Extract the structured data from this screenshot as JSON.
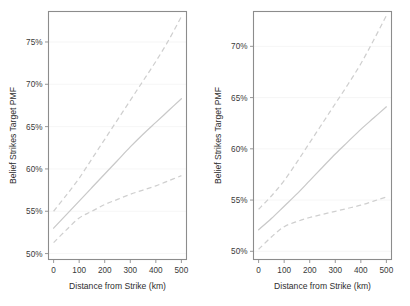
{
  "figure": {
    "background": "#ffffff",
    "line_color": "#c9c9c9",
    "frame_color": "#8c8c8c",
    "text_color": "#3a3a3a",
    "panel_count": 2
  },
  "chart_data": [
    {
      "type": "line",
      "panel": "left",
      "title": "",
      "xlabel": "Distance from Strike (km)",
      "ylabel": "Belief Strikes Target PMF",
      "xlim": [
        -20,
        520
      ],
      "ylim": [
        49.3,
        78.6
      ],
      "xticks": [
        0,
        100,
        200,
        300,
        400,
        500
      ],
      "xticklabels": [
        "0",
        "100",
        "200",
        "300",
        "400",
        "500"
      ],
      "yticks": [
        50,
        55,
        60,
        65,
        70,
        75
      ],
      "yticklabels": [
        "50%",
        "55%",
        "60%",
        "65%",
        "70%",
        "75%"
      ],
      "grid": true,
      "legend": "none",
      "x": [
        0,
        50,
        100,
        150,
        200,
        250,
        300,
        350,
        400,
        450,
        500
      ],
      "series": [
        {
          "name": "upper-confidence-bound",
          "style": "dashed",
          "values": [
            55.0,
            56.9,
            58.9,
            61.2,
            63.5,
            65.8,
            68.1,
            70.4,
            72.7,
            75.2,
            78.0
          ]
        },
        {
          "name": "point-estimate",
          "style": "solid",
          "values": [
            53.0,
            54.6,
            56.2,
            57.8,
            59.4,
            61.0,
            62.6,
            64.1,
            65.5,
            66.9,
            68.3
          ]
        },
        {
          "name": "lower-confidence-bound",
          "style": "dashed",
          "values": [
            51.3,
            52.8,
            54.2,
            55.0,
            55.8,
            56.4,
            57.0,
            57.5,
            58.0,
            58.6,
            59.2
          ]
        }
      ]
    },
    {
      "type": "line",
      "panel": "right",
      "title": "",
      "xlabel": "Distance from Strike (km)",
      "ylabel": "Belief Strikes Target PMF",
      "xlim": [
        -20,
        520
      ],
      "ylim": [
        49.2,
        73.4
      ],
      "xticks": [
        0,
        100,
        200,
        300,
        400,
        500
      ],
      "xticklabels": [
        "0",
        "100",
        "200",
        "300",
        "400",
        "500"
      ],
      "yticks": [
        50,
        55,
        60,
        65,
        70
      ],
      "yticklabels": [
        "50%",
        "55%",
        "60%",
        "65%",
        "70%"
      ],
      "grid": true,
      "legend": "none",
      "x": [
        0,
        50,
        100,
        150,
        200,
        250,
        300,
        350,
        400,
        450,
        500
      ],
      "series": [
        {
          "name": "upper-confidence-bound",
          "style": "dashed",
          "values": [
            54.1,
            55.4,
            56.9,
            58.7,
            60.6,
            62.5,
            64.4,
            66.3,
            68.3,
            70.6,
            73.0
          ]
        },
        {
          "name": "point-estimate",
          "style": "solid",
          "values": [
            52.1,
            53.2,
            54.4,
            55.6,
            56.9,
            58.2,
            59.5,
            60.7,
            61.9,
            63.0,
            64.1
          ]
        },
        {
          "name": "lower-confidence-bound",
          "style": "dashed",
          "values": [
            50.2,
            51.4,
            52.4,
            52.9,
            53.3,
            53.6,
            53.9,
            54.2,
            54.5,
            54.9,
            55.3
          ]
        }
      ]
    }
  ]
}
